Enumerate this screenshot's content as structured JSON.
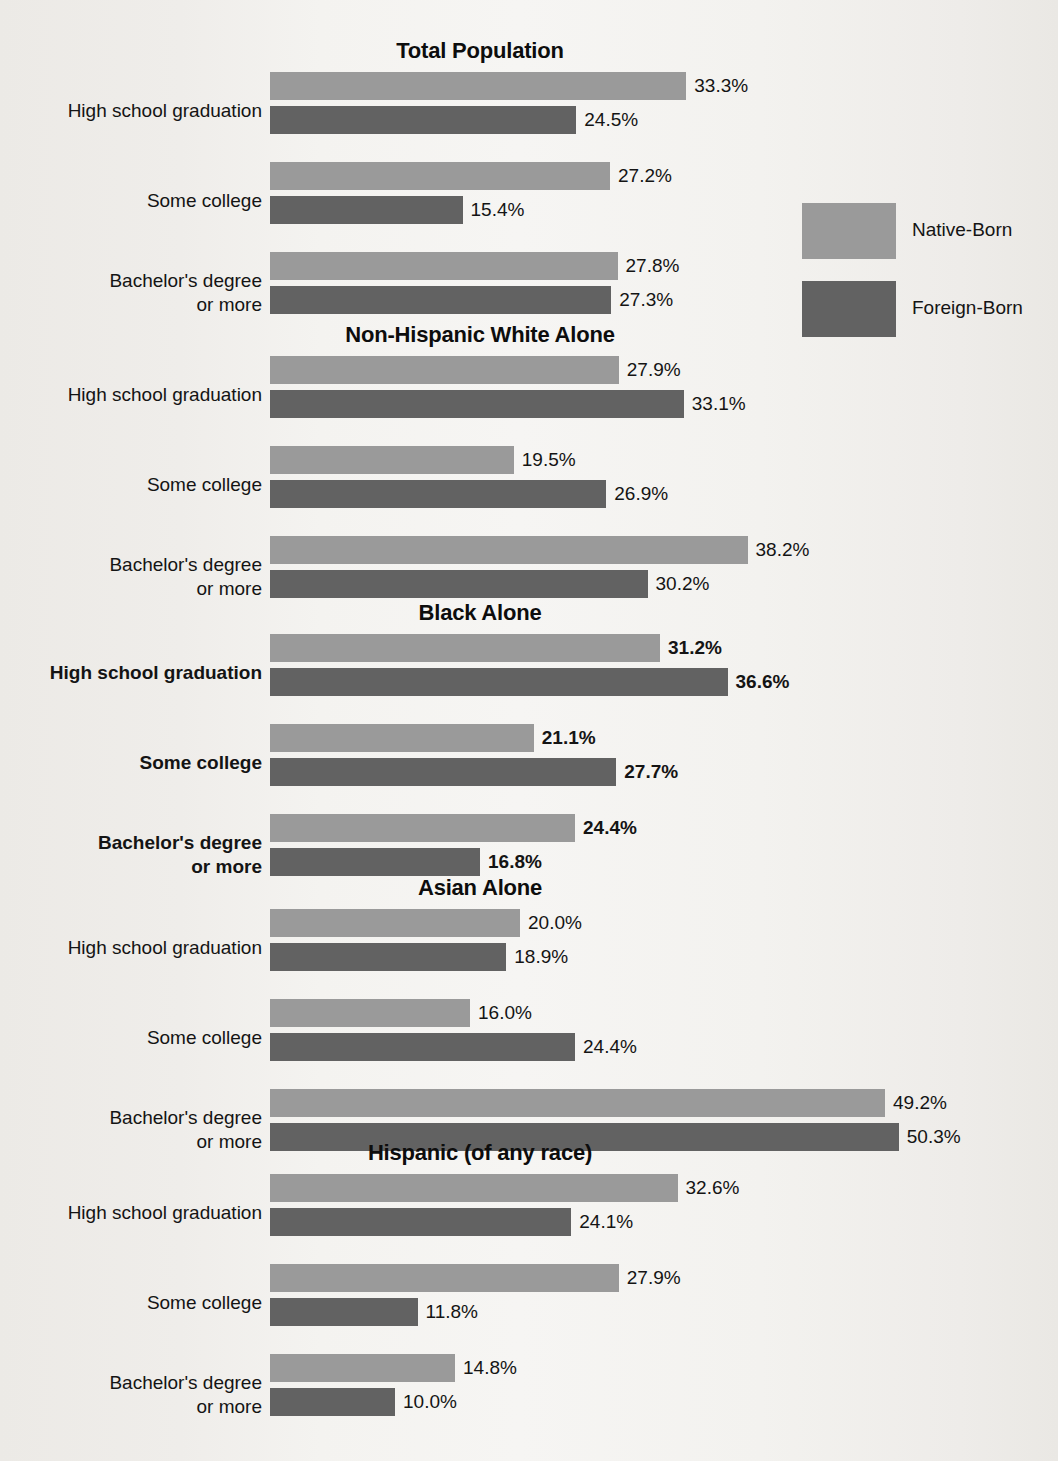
{
  "legend": {
    "items": [
      {
        "label": "Native-Born",
        "key": "native",
        "color": "#9a9a9a"
      },
      {
        "label": "Foreign-Born",
        "key": "foreign",
        "color": "#626262"
      }
    ]
  },
  "categories": [
    "High school graduation",
    "Some college",
    "Bachelor's degree or more"
  ],
  "chart_data": {
    "type": "bar",
    "title": "",
    "xlabel": "",
    "ylabel": "",
    "orientation": "horizontal",
    "grid": false,
    "legend_position": "right",
    "value_suffix": "%",
    "px_per_percent": 12.5,
    "xlim": [
      0,
      55
    ],
    "categories": [
      "High school graduation",
      "Some college",
      "Bachelor's degree or more"
    ],
    "series_names": [
      "Native-Born",
      "Foreign-Born"
    ],
    "panels": [
      {
        "title": "Total Population",
        "emphasis": false,
        "series": [
          {
            "name": "Native-Born",
            "values": [
              33.3,
              27.2,
              27.8
            ]
          },
          {
            "name": "Foreign-Born",
            "values": [
              24.5,
              15.4,
              27.3
            ]
          }
        ]
      },
      {
        "title": "Non-Hispanic White Alone",
        "emphasis": false,
        "series": [
          {
            "name": "Native-Born",
            "values": [
              27.9,
              19.5,
              38.2
            ]
          },
          {
            "name": "Foreign-Born",
            "values": [
              33.1,
              26.9,
              30.2
            ]
          }
        ]
      },
      {
        "title": "Black Alone",
        "emphasis": true,
        "series": [
          {
            "name": "Native-Born",
            "values": [
              31.2,
              21.1,
              24.4
            ]
          },
          {
            "name": "Foreign-Born",
            "values": [
              36.6,
              27.7,
              16.8
            ]
          }
        ]
      },
      {
        "title": "Asian Alone",
        "emphasis": false,
        "series": [
          {
            "name": "Native-Born",
            "values": [
              20.0,
              16.0,
              49.2
            ]
          },
          {
            "name": "Foreign-Born",
            "values": [
              18.9,
              24.4,
              50.3
            ]
          }
        ]
      },
      {
        "title": "Hispanic (of any race)",
        "emphasis": false,
        "series": [
          {
            "name": "Native-Born",
            "values": [
              32.6,
              27.9,
              14.8
            ]
          },
          {
            "name": "Foreign-Born",
            "values": [
              24.1,
              11.8,
              10.0
            ]
          }
        ]
      }
    ]
  },
  "labels": {
    "value_texts": {
      "Total Population": {
        "native": [
          "33.3%",
          "27.2%",
          "27.8%"
        ],
        "foreign": [
          "24.5%",
          "15.4%",
          "27.3%"
        ]
      },
      "Non-Hispanic White Alone": {
        "native": [
          "27.9%",
          "19.5%",
          "38.2%"
        ],
        "foreign": [
          "33.1%",
          "26.9%",
          "30.2%"
        ]
      },
      "Black Alone": {
        "native": [
          "31.2%",
          "21.1%",
          "24.4%"
        ],
        "foreign": [
          "36.6%",
          "27.7%",
          "16.8%"
        ]
      },
      "Asian Alone": {
        "native": [
          "20.0%",
          "16.0%",
          "49.2%"
        ],
        "foreign": [
          "18.9%",
          "24.4%",
          "50.3%"
        ]
      },
      "Hispanic (of any race)": {
        "native": [
          "32.6%",
          "27.9%",
          "14.8%"
        ],
        "foreign": [
          "24.1%",
          "11.8%",
          "10.0%"
        ]
      }
    },
    "category_lines": [
      [
        "High school graduation"
      ],
      [
        "Some college"
      ],
      [
        "Bachelor's degree",
        "or more"
      ]
    ]
  },
  "colors": {
    "native": "#9a9a9a",
    "foreign": "#626262",
    "text": "#141414",
    "background": "#f2f1ee"
  }
}
